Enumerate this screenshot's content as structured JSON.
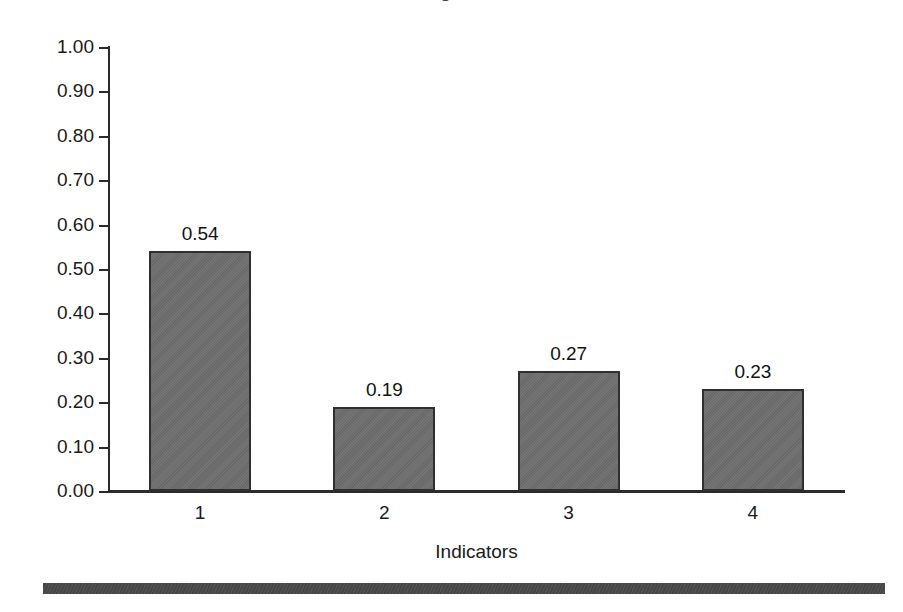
{
  "figure": {
    "background_color": "#ffffff",
    "title_remnant": "Figure",
    "bottom_rule_color": "#4a4a4a"
  },
  "chart_data": {
    "type": "bar",
    "title": "",
    "categories": [
      "1",
      "2",
      "3",
      "4"
    ],
    "values": [
      0.54,
      0.19,
      0.27,
      0.23
    ],
    "value_labels": [
      "0.54",
      "0.19",
      "0.27",
      "0.23"
    ],
    "xlabel": "Indicators",
    "ylabel": "",
    "ylim": [
      0.0,
      1.0
    ],
    "ytick_values": [
      1.0,
      0.9,
      0.8,
      0.7,
      0.6,
      0.5,
      0.4,
      0.3,
      0.2,
      0.1,
      0.0
    ],
    "ytick_labels": [
      "1.00",
      "0.90",
      "0.80",
      "0.70",
      "0.60",
      "0.50",
      "0.40",
      "0.30",
      "0.20",
      "0.10",
      "0.00"
    ],
    "grid": false,
    "legend": null,
    "bar_fill_color": "#6e6e6e",
    "bar_edge_color": "#2f2f2f",
    "axis_color": "#2b2b2b"
  }
}
